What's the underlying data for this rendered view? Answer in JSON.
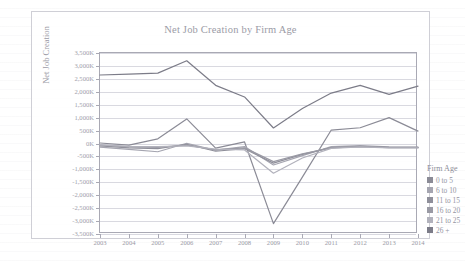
{
  "figure": {
    "title": "Net Job Creation by Firm Age",
    "y_axis_title": "Net Job Creation",
    "legend_title": "Firm Age"
  },
  "chart_data": {
    "type": "line",
    "title": "Net Job Creation by Firm Age",
    "xlabel": "",
    "ylabel": "Net Job Creation",
    "grid": true,
    "legend_position": "right",
    "legend_title": "Firm Age",
    "x": [
      2003,
      2004,
      2005,
      2006,
      2007,
      2008,
      2009,
      2010,
      2011,
      2012,
      2013,
      2014
    ],
    "x_tick_labels": [
      "2003",
      "2004",
      "2005",
      "2006",
      "2007",
      "2008",
      "2009",
      "2010",
      "2011",
      "2012",
      "2013",
      "2014"
    ],
    "ylim": [
      -3500,
      3500
    ],
    "y_tick_values": [
      3500,
      3000,
      2500,
      2000,
      1500,
      1000,
      500,
      0,
      -500,
      -1000,
      -1500,
      -2000,
      -2500,
      -3000,
      -3500
    ],
    "y_tick_labels": [
      "3,500K",
      "3,000K",
      "2,500K",
      "2,000K",
      "1,500K",
      "1,000K",
      "500K",
      "0K",
      "-500K",
      "-1,000K",
      "-1,500K",
      "-2,000K",
      "-2,500K",
      "-3,000K",
      "-3,500K"
    ],
    "y_units": "thousands of jobs",
    "series": [
      {
        "name": "0 to 5",
        "color": "#8b8b96",
        "values": [
          20,
          -60,
          180,
          950,
          -180,
          60,
          -3100,
          -1300,
          520,
          610,
          1000,
          480
        ]
      },
      {
        "name": "6 to 10",
        "color": "#a5a5b0",
        "values": [
          -140,
          -230,
          -320,
          10,
          -260,
          -120,
          -830,
          -470,
          -120,
          -80,
          -130,
          -140
        ]
      },
      {
        "name": "11 to 15",
        "color": "#8f8f9a",
        "values": [
          -90,
          -170,
          -200,
          -30,
          -300,
          -200,
          -760,
          -420,
          -160,
          -110,
          -150,
          -150
        ]
      },
      {
        "name": "16 to 20",
        "color": "#9a9aa4",
        "values": [
          -60,
          -130,
          -150,
          -60,
          -250,
          -170,
          -700,
          -400,
          -170,
          -120,
          -160,
          -160
        ]
      },
      {
        "name": "21 to 25",
        "color": "#b2b2bc",
        "values": [
          -50,
          -110,
          -120,
          -90,
          -220,
          -250,
          -1150,
          -560,
          -190,
          -130,
          -170,
          -170
        ]
      },
      {
        "name": "26 +",
        "color": "#7c7c88",
        "values": [
          2650,
          2680,
          2720,
          3200,
          2250,
          1800,
          600,
          1350,
          1950,
          2250,
          1900,
          2220
        ]
      }
    ]
  }
}
